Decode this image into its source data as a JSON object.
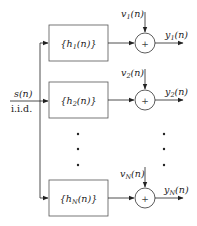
{
  "diagram": {
    "input": {
      "label_main": "s(n)",
      "label_sub": "i.i.d."
    },
    "branches": [
      {
        "filter_pre": "{h",
        "filter_sub": "1",
        "filter_post": "(n)}",
        "noise_pre": "v",
        "noise_sub": "1",
        "noise_post": "(n)",
        "output_pre": "y",
        "output_sub": "1",
        "output_post": "(n)",
        "plus": "+"
      },
      {
        "filter_pre": "{h",
        "filter_sub": "2",
        "filter_post": "(n)}",
        "noise_pre": "v",
        "noise_sub": "2",
        "noise_post": "(n)",
        "output_pre": "y",
        "output_sub": "2",
        "output_post": "(n)",
        "plus": "+"
      },
      {
        "filter_pre": "{h",
        "filter_sub": "N",
        "filter_post": "(n)}",
        "noise_pre": "v",
        "noise_sub": "N",
        "noise_post": "(n)",
        "output_pre": "y",
        "output_sub": "N",
        "output_post": "(n)",
        "plus": "+"
      }
    ],
    "ellipsis": "⋮",
    "colors": {
      "line": "#222222",
      "box": "#555555",
      "text": "#222222"
    }
  }
}
